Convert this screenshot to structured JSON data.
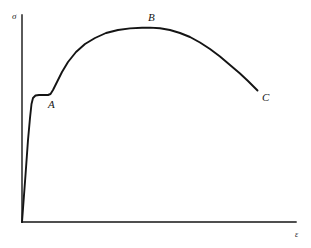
{
  "figure": {
    "name": "stress-strain-curve",
    "background_color": "#ffffff",
    "line_color": "#141414"
  },
  "axes": {
    "y": {
      "symbol": "σ",
      "name": "stress",
      "x_px": 22,
      "top_px": 15,
      "bottom_px": 222
    },
    "x": {
      "symbol": "ε",
      "name": "strain",
      "y_px": 222,
      "left_px": 22,
      "right_px": 296
    },
    "origin": {
      "x_px": 22,
      "y_px": 222
    },
    "ticks": [],
    "grid": false
  },
  "annotations": [
    {
      "label": "A",
      "name": "point-label-a",
      "meaning": "end of yield plateau / lower yield point",
      "x_px": 48,
      "y_px": 99
    },
    {
      "label": "B",
      "name": "point-label-b",
      "meaning": "ultimate tensile strength (curve maximum)",
      "x_px": 148,
      "y_px": 12
    },
    {
      "label": "C",
      "name": "point-label-c",
      "meaning": "fracture point (curve end)",
      "x_px": 262,
      "y_px": 92
    }
  ],
  "chart_data": {
    "type": "line",
    "title": "",
    "xlabel": "ε",
    "ylabel": "σ",
    "grid": false,
    "legend": null,
    "xlim": [
      0,
      1
    ],
    "ylim": [
      0,
      1
    ],
    "series": [
      {
        "name": "stress-strain",
        "color": "#141414",
        "path_d": "M 22 222 L 25.5 175 L 28 140 L 30 118 L 31.5 104 L 33 98 L 35.5 95.5 L 39 95 L 44 95 L 48 95 L 50.5 94 L 53 90 L 57 82 L 62 72 L 68 62 L 76 52 L 85 44 L 95 38 L 106 33 L 118 30 L 130 28.4 L 142 27.7 L 150 27.6 L 160 28.2 L 170 30 L 180 33 L 190 37 L 200 42.5 L 210 49 L 220 56.5 L 230 65 L 240 73.5 L 248 81 L 253 86 L 257.5 90.5",
        "key_points_px": [
          {
            "x": 22,
            "y": 222,
            "note": "origin"
          },
          {
            "x": 33,
            "y": 98,
            "note": "upper yield point"
          },
          {
            "x": 39,
            "y": 95,
            "note": "yield plateau"
          },
          {
            "x": 50,
            "y": 95,
            "note": "point A - end of plateau"
          },
          {
            "x": 150,
            "y": 27.6,
            "note": "point B - ultimate strength"
          },
          {
            "x": 257.5,
            "y": 90.5,
            "note": "point C - fracture"
          }
        ]
      }
    ]
  }
}
